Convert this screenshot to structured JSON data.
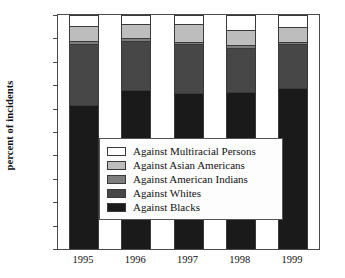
{
  "chart_data": {
    "type": "bar",
    "stacked": true,
    "title": "",
    "xlabel": "",
    "ylabel": "percent of incidents",
    "categories": [
      "1995",
      "1996",
      "1997",
      "1998",
      "1999"
    ],
    "ylim": [
      0,
      100
    ],
    "yticks": [
      0,
      10,
      20,
      30,
      40,
      50,
      60,
      70,
      80,
      90,
      100
    ],
    "grid": false,
    "legend_position": "center",
    "series": [
      {
        "name": "Against Blacks",
        "color": "#1a1a1a",
        "values": [
          61.5,
          68.0,
          66.5,
          67.0,
          69.0
        ]
      },
      {
        "name": "Against Whites",
        "color": "#474747",
        "values": [
          26.0,
          21.0,
          21.0,
          19.0,
          18.5
        ]
      },
      {
        "name": "Against American Indians",
        "color": "#7d7d7d",
        "values": [
          1.5,
          1.0,
          1.0,
          1.0,
          1.0
        ]
      },
      {
        "name": "Against Asian Americans",
        "color": "#bdbdbd",
        "values": [
          6.5,
          6.0,
          7.5,
          6.5,
          6.5
        ]
      },
      {
        "name": "Against Multiracial Persons",
        "color": "#ffffff",
        "values": [
          4.5,
          4.0,
          4.0,
          6.5,
          5.0
        ]
      }
    ]
  },
  "legend": {
    "items": [
      {
        "label": "Against Multiracial Persons",
        "color": "#ffffff"
      },
      {
        "label": "Against Asian Americans",
        "color": "#bdbdbd"
      },
      {
        "label": "Against American Indians",
        "color": "#7d7d7d"
      },
      {
        "label": "Against Whites",
        "color": "#474747"
      },
      {
        "label": "Against Blacks",
        "color": "#1a1a1a"
      }
    ]
  },
  "axis": {
    "y_title": "percent of incidents"
  }
}
